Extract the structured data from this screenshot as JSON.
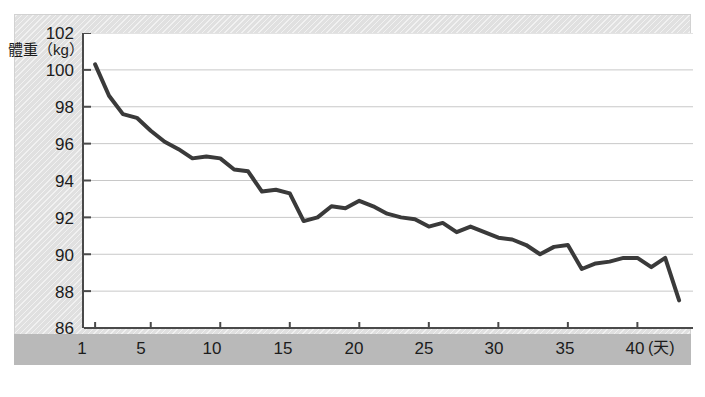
{
  "chart_data": {
    "type": "line",
    "title": "",
    "xlabel": "天",
    "ylabel": "體重（kg）",
    "ylabel_text": "體重",
    "ylabel_unit": "(kg)",
    "xlim": [
      0.2,
      44.0
    ],
    "ylim": [
      86,
      102
    ],
    "yticks": [
      102,
      100,
      98,
      96,
      94,
      92,
      90,
      88,
      86
    ],
    "xticks": [
      1,
      5,
      10,
      15,
      20,
      25,
      30,
      35,
      40
    ],
    "xtick_labels": [
      "1",
      "5",
      "10",
      "15",
      "20",
      "25",
      "30",
      "35",
      "40"
    ],
    "x_axis_unit_label": "(天)",
    "grid": "horizontal",
    "legend": "none",
    "series": [
      {
        "name": "體重",
        "color": "#3a3a3a",
        "line_width": 4,
        "x": [
          1,
          2,
          3,
          4,
          5,
          6,
          7,
          8,
          9,
          10,
          11,
          12,
          13,
          14,
          15,
          16,
          17,
          18,
          19,
          20,
          21,
          22,
          23,
          24,
          25,
          26,
          27,
          28,
          29,
          30,
          31,
          32,
          33,
          34,
          35,
          36,
          37,
          38,
          39,
          40,
          41,
          42,
          43
        ],
        "values": [
          100.3,
          98.6,
          97.6,
          97.4,
          96.7,
          96.1,
          95.7,
          95.2,
          95.3,
          95.2,
          94.6,
          94.5,
          93.4,
          93.5,
          93.3,
          91.8,
          92.0,
          92.6,
          92.5,
          92.9,
          92.6,
          92.2,
          92.0,
          91.9,
          91.5,
          91.7,
          91.2,
          91.5,
          91.2,
          90.9,
          90.8,
          90.5,
          90.0,
          90.4,
          90.5,
          89.2,
          89.5,
          89.6,
          89.8,
          89.8,
          89.3,
          89.8,
          87.5
        ]
      }
    ]
  },
  "axis": {
    "y_unit_caption": "體重（kg）"
  }
}
